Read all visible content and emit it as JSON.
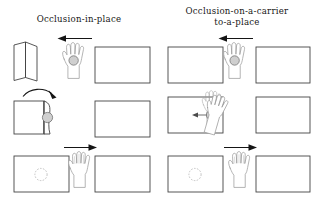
{
  "figure": {
    "width": 316,
    "height": 197,
    "background": "#ffffff",
    "ink": "#444444",
    "arrow_color": "#151515",
    "puck_fill": "#cfcfcf"
  },
  "columns": [
    {
      "id": "occlusion-in-place",
      "title": "Occlusion-in-place",
      "rows": [
        {
          "id": "row-1",
          "source": {
            "shape": "folded-card",
            "label": "folded card"
          },
          "hand": {
            "state": "holding",
            "object": "puck",
            "object_visible": true
          },
          "target": {
            "shape": "rectangle",
            "label": "place"
          },
          "arrow": {
            "direction": "left",
            "style": "straight"
          }
        },
        {
          "id": "row-2",
          "source": {
            "shape": "card-with-open-flap",
            "label": "card with flap",
            "object_visible": true
          },
          "hand": {
            "state": "absent",
            "object": "none",
            "object_visible": false
          },
          "target": {
            "shape": "rectangle",
            "label": "place"
          },
          "arrow": {
            "direction": "right",
            "style": "curved"
          }
        },
        {
          "id": "row-3",
          "source": {
            "shape": "rectangle-with-ghost-puck",
            "label": "place with occluded object"
          },
          "hand": {
            "state": "empty",
            "object": "none",
            "object_visible": false
          },
          "target": {
            "shape": "rectangle",
            "label": "place"
          },
          "arrow": {
            "direction": "right",
            "style": "straight"
          }
        }
      ]
    },
    {
      "id": "occlusion-on-a-carrier-to-a-place",
      "title": "Occlusion-on-a-carrier",
      "title_line2": "to-a-place",
      "rows": [
        {
          "id": "row-1",
          "source": {
            "shape": "rectangle",
            "label": "carrier"
          },
          "hand": {
            "state": "holding",
            "object": "puck",
            "object_visible": true
          },
          "target": {
            "shape": "rectangle",
            "label": "place"
          },
          "arrow": {
            "direction": "left",
            "style": "straight"
          }
        },
        {
          "id": "row-2",
          "source": {
            "shape": "rectangle-with-dotted-hand",
            "label": "carrier with occluding hand",
            "object_visible": true
          },
          "hand": {
            "state": "placing",
            "object": "puck",
            "object_visible": true
          },
          "target": {
            "shape": "rectangle",
            "label": "place"
          },
          "arrow": {
            "direction": "left",
            "style": "short-inset"
          }
        },
        {
          "id": "row-3",
          "source": {
            "shape": "rectangle-with-ghost-puck",
            "label": "carrier with occluded object"
          },
          "hand": {
            "state": "empty",
            "object": "none",
            "object_visible": false
          },
          "target": {
            "shape": "rectangle",
            "label": "place"
          },
          "arrow": {
            "direction": "right",
            "style": "straight"
          }
        }
      ]
    }
  ]
}
